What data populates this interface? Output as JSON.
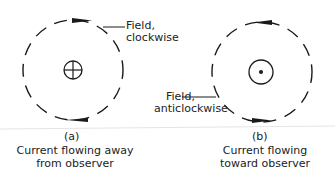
{
  "figure": {
    "panel_a": {
      "tag": "(a)",
      "caption_line1": "Current flowing away",
      "caption_line2": "from observer",
      "field_label_line1": "Field,",
      "field_label_line2": "clockwise",
      "conductor_symbol": "cross-in-circle-icon",
      "field_direction": "clockwise"
    },
    "panel_b": {
      "tag": "(b)",
      "caption_line1": "Current flowing",
      "caption_line2": "toward observer",
      "field_label_line1": "Field,",
      "field_label_line2": "anticlockwise",
      "conductor_symbol": "dot-in-circle-icon",
      "field_direction": "anticlockwise"
    }
  }
}
